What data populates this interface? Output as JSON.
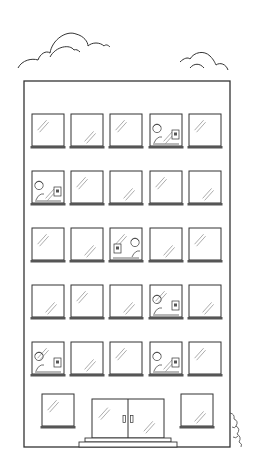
{
  "illustration": {
    "subject": "office building with workers at computers",
    "colors": {
      "line": "#333333",
      "sill": "#555555",
      "background": "#ffffff",
      "glare": "#888888"
    },
    "building": {
      "x": 24,
      "y": 81,
      "width": 206,
      "height": 366
    },
    "clouds": [
      {
        "name": "cloud-left",
        "x": 18,
        "y": 28
      },
      {
        "name": "cloud-right",
        "x": 180,
        "y": 52
      }
    ],
    "window_columns": [
      32,
      71,
      110,
      150,
      189
    ],
    "window_rows": [
      114,
      171,
      228,
      285,
      342
    ],
    "window_size": {
      "w": 32,
      "h": 32
    },
    "occupied_windows": [
      {
        "row": 0,
        "col": 3,
        "facing": "right"
      },
      {
        "row": 1,
        "col": 0,
        "facing": "right"
      },
      {
        "row": 2,
        "col": 2,
        "facing": "left"
      },
      {
        "row": 3,
        "col": 3,
        "facing": "right"
      },
      {
        "row": 4,
        "col": 0,
        "facing": "right"
      },
      {
        "row": 4,
        "col": 3,
        "facing": "right"
      }
    ],
    "ground_floor": {
      "windows": [
        {
          "x": 42,
          "y": 394,
          "w": 32,
          "h": 32
        },
        {
          "x": 181,
          "y": 394,
          "w": 32,
          "h": 32
        }
      ],
      "door": {
        "x": 92,
        "y": 399,
        "w": 72,
        "h": 39
      },
      "steps": [
        {
          "x": 85,
          "y": 438,
          "w": 86,
          "h": 4
        },
        {
          "x": 79,
          "y": 442,
          "w": 98,
          "h": 5
        }
      ]
    },
    "bush": {
      "x": 230,
      "y": 413
    }
  }
}
